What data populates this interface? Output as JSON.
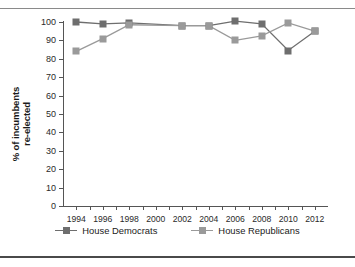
{
  "chart_data": {
    "type": "line",
    "title": "",
    "xlabel": "",
    "ylabel": "% of incumbents re-elected",
    "ylabel_line1": "% of incumbents",
    "ylabel_line2": "re-elected",
    "categories": [
      "1994",
      "1996",
      "1998",
      "2000",
      "2002",
      "2004",
      "2006",
      "2008",
      "2010",
      "2012"
    ],
    "x": [
      1994,
      1996,
      1998,
      2000,
      2002,
      2004,
      2006,
      2008,
      2010,
      2012
    ],
    "xlim": [
      1993,
      2013
    ],
    "ylim": [
      0,
      100
    ],
    "yticks": [
      0,
      10,
      20,
      30,
      40,
      50,
      60,
      70,
      80,
      90,
      100
    ],
    "ytick_labels": [
      "0",
      "10",
      "20",
      "30",
      "40",
      "50",
      "60",
      "70",
      "80",
      "90",
      "100"
    ],
    "grid": false,
    "legend_position": "bottom",
    "series": [
      {
        "name": "House Democrats",
        "color": "#6e6e6e",
        "x": [
          1994,
          1996,
          1998,
          2002,
          2004,
          2006,
          2008,
          2010,
          2012
        ],
        "values": [
          100,
          99,
          99.5,
          98,
          98,
          100.5,
          99,
          84.5,
          95
        ]
      },
      {
        "name": "House Republicans",
        "color": "#9a9a9a",
        "x": [
          1994,
          1996,
          1998,
          2002,
          2004,
          2006,
          2008,
          2010,
          2012
        ],
        "values": [
          84,
          91,
          98.5,
          98,
          98,
          90,
          92.5,
          99.5,
          95
        ]
      }
    ]
  },
  "legend": {
    "items": [
      {
        "label": "House Democrats",
        "color": "#6e6e6e"
      },
      {
        "label": "House Republicans",
        "color": "#9a9a9a"
      }
    ]
  },
  "colors": {
    "democrats": "#6e6e6e",
    "republicans": "#9a9a9a",
    "axis": "#555555",
    "text": "#1a1a1a",
    "rule": "#8a8a8a"
  }
}
